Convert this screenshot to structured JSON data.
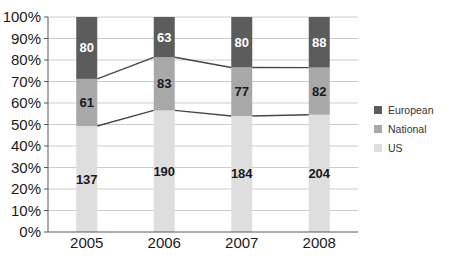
{
  "chart_data": {
    "type": "bar",
    "subtype": "100%-stacked-column-with-series-lines",
    "title": "",
    "xlabel": "",
    "ylabel": "",
    "categories": [
      "2005",
      "2006",
      "2007",
      "2008"
    ],
    "series": [
      {
        "name": "US",
        "values": [
          137,
          190,
          184,
          204
        ],
        "color": "#dedede",
        "label_color": "#1a1a1a"
      },
      {
        "name": "National",
        "values": [
          61,
          83,
          77,
          82
        ],
        "color": "#a8a8a8",
        "label_color": "#1a1a1a"
      },
      {
        "name": "European",
        "values": [
          80,
          63,
          80,
          88
        ],
        "color": "#5c5c5c",
        "label_color": "#ffffff"
      }
    ],
    "y_axis": {
      "ticks": [
        "0%",
        "10%",
        "20%",
        "30%",
        "40%",
        "50%",
        "60%",
        "70%",
        "80%",
        "90%",
        "100%"
      ],
      "min": 0,
      "max": 100,
      "format": "percent"
    },
    "grid": true,
    "series_lines": true,
    "legend": {
      "position": "right",
      "entries": [
        "European",
        "National",
        "US"
      ]
    }
  },
  "style": {
    "background": "#ffffff",
    "gridline_color": "#cccccc",
    "axis_color": "#595959",
    "series_line_color": "#474747",
    "tick_text_color": "#1a1a1a",
    "legend_text_color": "#333333"
  }
}
